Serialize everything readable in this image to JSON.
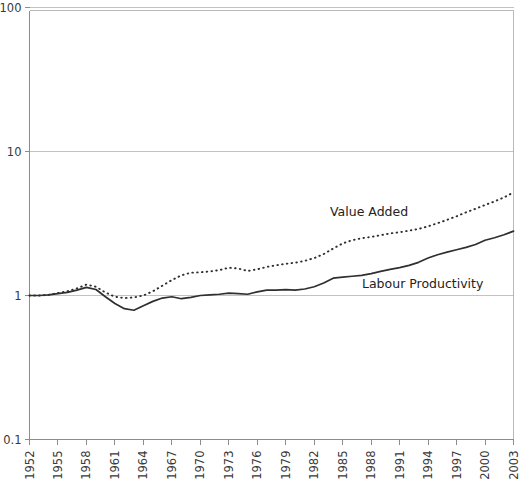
{
  "chart_data": {
    "type": "line",
    "title": "",
    "subtitle": "",
    "xlabel": "",
    "ylabel": "",
    "yscale": "log",
    "ylim": [
      0.1,
      100
    ],
    "ytick_labels": [
      "100",
      "10",
      "1",
      "0.1"
    ],
    "ytick_values": [
      100,
      10,
      1,
      0.1
    ],
    "xlim": [
      1952,
      2003
    ],
    "xtick_labels": [
      "1952",
      "1955",
      "1958",
      "1961",
      "1964",
      "1967",
      "1970",
      "1973",
      "1976",
      "1979",
      "1982",
      "1985",
      "1988",
      "1991",
      "1994",
      "1997",
      "2000",
      "2003"
    ],
    "xtick_values": [
      1952,
      1955,
      1958,
      1961,
      1964,
      1967,
      1970,
      1973,
      1976,
      1979,
      1982,
      1985,
      1988,
      1991,
      1994,
      1997,
      2000,
      2003
    ],
    "grid": "horizontal",
    "legend": "inline-annotations",
    "x": [
      1952,
      1953,
      1954,
      1955,
      1956,
      1957,
      1958,
      1959,
      1960,
      1961,
      1962,
      1963,
      1964,
      1965,
      1966,
      1967,
      1968,
      1969,
      1970,
      1971,
      1972,
      1973,
      1974,
      1975,
      1976,
      1977,
      1978,
      1979,
      1980,
      1981,
      1982,
      1983,
      1984,
      1985,
      1986,
      1987,
      1988,
      1989,
      1990,
      1991,
      1992,
      1993,
      1994,
      1995,
      1996,
      1997,
      1998,
      1999,
      2000,
      2001,
      2002,
      2003
    ],
    "series": [
      {
        "name": "Value Added",
        "style": "dotted",
        "color": "#2f2f2f",
        "annotation": "Value Added",
        "values": [
          1.0,
          1.0,
          1.01,
          1.04,
          1.07,
          1.12,
          1.19,
          1.15,
          1.05,
          0.98,
          0.96,
          0.97,
          1.0,
          1.07,
          1.17,
          1.28,
          1.38,
          1.44,
          1.45,
          1.47,
          1.5,
          1.56,
          1.54,
          1.48,
          1.52,
          1.58,
          1.62,
          1.66,
          1.69,
          1.74,
          1.82,
          1.94,
          2.12,
          2.3,
          2.42,
          2.5,
          2.55,
          2.62,
          2.7,
          2.75,
          2.82,
          2.9,
          3.02,
          3.18,
          3.35,
          3.55,
          3.78,
          4.0,
          4.25,
          4.5,
          4.8,
          5.2
        ]
      },
      {
        "name": "Labour Productivity",
        "style": "solid",
        "color": "#2f2f2f",
        "annotation": "Labour Productivity",
        "values": [
          1.0,
          1.0,
          1.01,
          1.03,
          1.05,
          1.09,
          1.14,
          1.1,
          0.98,
          0.88,
          0.81,
          0.79,
          0.85,
          0.91,
          0.96,
          0.98,
          0.95,
          0.97,
          1.0,
          1.01,
          1.02,
          1.04,
          1.03,
          1.02,
          1.06,
          1.09,
          1.09,
          1.1,
          1.09,
          1.11,
          1.15,
          1.22,
          1.32,
          1.34,
          1.36,
          1.38,
          1.42,
          1.47,
          1.52,
          1.56,
          1.62,
          1.7,
          1.82,
          1.92,
          2.0,
          2.08,
          2.16,
          2.26,
          2.42,
          2.52,
          2.64,
          2.8
        ]
      }
    ]
  },
  "annotations": {
    "value_added_label": "Value Added",
    "labour_productivity_label": "Labour Productivity"
  }
}
